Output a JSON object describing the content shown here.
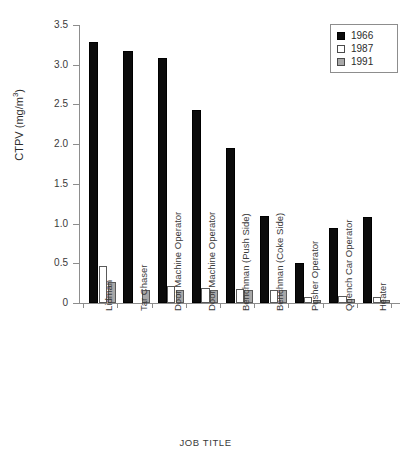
{
  "chart_data": {
    "type": "bar",
    "title": "",
    "xlabel": "JOB TITLE",
    "ylabel": "CTPV (mg/m3)",
    "ylabel_parts": {
      "main": "CTPV (mg/m",
      "sup": "3",
      "tail": ")"
    },
    "ylim": [
      0,
      3.5
    ],
    "yticks": [
      0,
      0.5,
      1.0,
      1.5,
      2.0,
      2.5,
      3.0,
      3.5
    ],
    "ytick_labels": [
      "0",
      "0.5",
      "1.0",
      "1.5",
      "2.0",
      "2.5",
      "3.0",
      "3.5"
    ],
    "grid": false,
    "legend_position": "top-right",
    "categories": [
      "Lidman",
      "Tar Chaser",
      "Door Machine Operator",
      "Door Machine Operator",
      "Benchman (Push Side)",
      "Benchman (Coke Side)",
      "Pusher Operator",
      "Quench Car Operator",
      "Heater"
    ],
    "series": [
      {
        "name": "1966",
        "color": "#0b0b0b",
        "values": [
          3.28,
          3.17,
          3.09,
          2.43,
          1.95,
          1.1,
          0.5,
          0.94,
          1.08
        ]
      },
      {
        "name": "1987",
        "color": "#ffffff",
        "values": [
          0.46,
          0.0,
          0.22,
          0.19,
          0.18,
          0.17,
          0.08,
          0.09,
          0.07
        ]
      },
      {
        "name": "1991",
        "color": "#a8a8a8",
        "values": [
          0.27,
          0.16,
          0.17,
          0.17,
          0.17,
          0.17,
          0.04,
          0.05,
          0.04
        ]
      }
    ]
  },
  "legend": {
    "entries": [
      {
        "label": "1966",
        "swatch": "filled-black-square-icon"
      },
      {
        "label": "1987",
        "swatch": "empty-white-square-icon"
      },
      {
        "label": "1991",
        "swatch": "filled-gray-square-icon"
      }
    ]
  }
}
